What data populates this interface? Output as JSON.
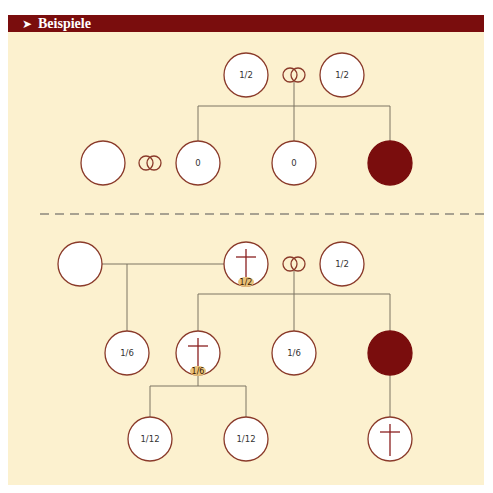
{
  "header": {
    "arrow": "➤",
    "title": "Beispiele"
  },
  "colors": {
    "header_bg": "#7a0d0d",
    "panel_bg": "#fcf1cf",
    "node_stroke": "#8a3a2a",
    "node_fill": "#ffffff",
    "affected_fill": "#7a0d0d",
    "line": "#7d7462",
    "cross": "#8a2020",
    "badge_fill": "#e9c27a",
    "divider": "#555555"
  },
  "example1": {
    "nodes": [
      {
        "id": "mother",
        "cx": 246,
        "cy": 75,
        "label": "1/2"
      },
      {
        "id": "father",
        "cx": 342,
        "cy": 75,
        "label": "1/2"
      },
      {
        "id": "spouse",
        "cx": 103,
        "cy": 163,
        "label": ""
      },
      {
        "id": "child1",
        "cx": 198,
        "cy": 163,
        "label": "0"
      },
      {
        "id": "child2",
        "cx": 294,
        "cy": 163,
        "label": "0"
      },
      {
        "id": "child3",
        "cx": 390,
        "cy": 163,
        "label": "",
        "affected": true
      }
    ],
    "marriages": [
      {
        "cx": 294,
        "cy": 75
      },
      {
        "cx": 150,
        "cy": 163
      }
    ]
  },
  "example2": {
    "nodes": [
      {
        "id": "ex-spouse",
        "cx": 80,
        "cy": 264,
        "label": ""
      },
      {
        "id": "deceased-parent",
        "cx": 246,
        "cy": 264,
        "label": "",
        "deceased": true,
        "badge": "1/2"
      },
      {
        "id": "spouse",
        "cx": 342,
        "cy": 264,
        "label": "1/2"
      },
      {
        "id": "halfchild",
        "cx": 127,
        "cy": 353,
        "label": "1/6"
      },
      {
        "id": "deceased-child",
        "cx": 198,
        "cy": 353,
        "label": "",
        "deceased": true,
        "badge": "1/6"
      },
      {
        "id": "child2",
        "cx": 294,
        "cy": 353,
        "label": "1/6"
      },
      {
        "id": "child3",
        "cx": 390,
        "cy": 353,
        "label": "",
        "affected": true
      },
      {
        "id": "grandchild1",
        "cx": 150,
        "cy": 439,
        "label": "1/12"
      },
      {
        "id": "grandchild2",
        "cx": 246,
        "cy": 439,
        "label": "1/12"
      },
      {
        "id": "grandchild3",
        "cx": 390,
        "cy": 439,
        "label": "",
        "deceased": true
      }
    ],
    "marriages": [
      {
        "cx": 294,
        "cy": 264
      }
    ]
  }
}
